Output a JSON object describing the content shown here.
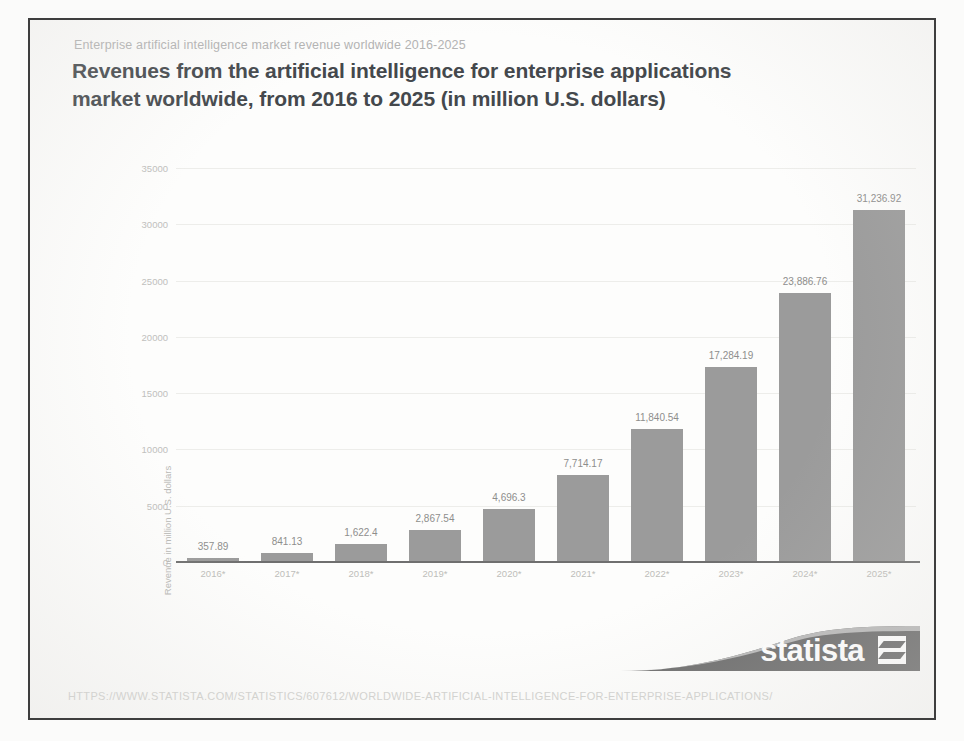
{
  "page": {
    "kicker": "Enterprise artificial intelligence market revenue worldwide 2016-2025",
    "headline_line1": "Revenues from the artificial intelligence for enterprise applications",
    "headline_line2": "market worldwide, from 2016 to 2025 (in million U.S. dollars)",
    "footer_url": "HTTPS://WWW.STATISTA.COM/STATISTICS/607612/WORLDWIDE-ARTIFICIAL-INTELLIGENCE-FOR-ENTERPRISE-APPLICATIONS/",
    "logo_text": "statista"
  },
  "chart_data": {
    "type": "bar",
    "title": "Revenues from the artificial intelligence for enterprise applications market worldwide, from 2016 to 2025 (in million U.S. dollars)",
    "subtitle": "Enterprise artificial intelligence market revenue worldwide 2016-2025",
    "xlabel": "",
    "ylabel": "Revenue in million U.S. dollars",
    "categories": [
      "2016*",
      "2017*",
      "2018*",
      "2019*",
      "2020*",
      "2021*",
      "2022*",
      "2023*",
      "2024*",
      "2025*"
    ],
    "values": [
      357.89,
      841.13,
      1622.4,
      2867.54,
      4696.3,
      7714.17,
      11840.54,
      17284.19,
      23886.76,
      31236.92
    ],
    "value_labels": [
      "357.89",
      "841.13",
      "1,622.4",
      "2,867.54",
      "4,696.3",
      "7,714.17",
      "11,840.54",
      "17,284.19",
      "23,886.76",
      "31,236.92"
    ],
    "ylim": [
      0,
      35000
    ],
    "yticks": [
      0,
      5000,
      10000,
      15000,
      20000,
      25000,
      30000,
      35000
    ],
    "ytick_labels": [
      "0",
      "5000",
      "10000",
      "15000",
      "20000",
      "25000",
      "30000",
      "35000"
    ],
    "grid": true,
    "legend": "none",
    "series_color": "#9b9b9b"
  }
}
